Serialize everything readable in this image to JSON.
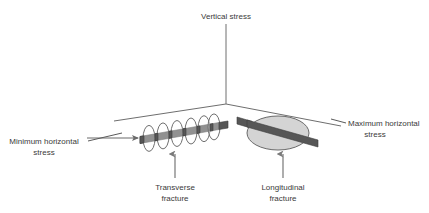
{
  "figure": {
    "title_present": false,
    "background_color": "#ffffff",
    "width": 429,
    "height": 213
  },
  "colors": {
    "axis": "#6e6e6e",
    "leader": "#5a5a5a",
    "wellbore_dark": "#565656",
    "wellbore_light": "#8e8e8e",
    "fracture_fill": "#d4d4d4",
    "disc_stroke": "#707070",
    "text": "#3a3a3a"
  },
  "labels": {
    "vertical_stress": "Vertical stress",
    "minimum_horizontal_stress_line1": "Minimum horizontal",
    "minimum_horizontal_stress_line2": "stress",
    "maximum_horizontal_stress_line1": "Maximum horizontal",
    "maximum_horizontal_stress_line2": "stress",
    "transverse_fracture_line1": "Transverse",
    "transverse_fracture_line2": "fracture",
    "longitudinal_fracture_line1": "Longitudinal",
    "longitudinal_fracture_line2": "fracture"
  },
  "axes": {
    "origin": {
      "x": 226,
      "y": 104
    },
    "vertical": {
      "x1": 226,
      "y1": 24,
      "x2": 226,
      "y2": 104
    },
    "left_horizontal": {
      "x1": 114,
      "y1": 121,
      "x2": 226,
      "y2": 104
    },
    "right_horizontal": {
      "x1": 226,
      "y1": 104,
      "x2": 341,
      "y2": 126
    }
  },
  "features": {
    "transverse": {
      "name": "transverse-fracture",
      "disc_count": 6,
      "wellbore": {
        "x1": 140,
        "y1": 140,
        "x2": 219,
        "y2": 126
      },
      "disc_rx": 6,
      "disc_ry": 13
    },
    "longitudinal": {
      "name": "longitudinal-fracture",
      "ellipse": {
        "cx": 278,
        "cy": 133,
        "rx": 31,
        "ry": 17
      },
      "wellbore": {
        "x1": 237,
        "y1": 120,
        "x2": 318,
        "y2": 143
      }
    }
  },
  "annotations": {
    "min_stress_arrow": {
      "x1": 87,
      "y1": 138,
      "x2": 140,
      "y2": 138
    },
    "transverse_arrow": {
      "x1": 175,
      "y1": 178,
      "x2": 175,
      "y2": 152
    },
    "longitudinal_arrow": {
      "x1": 283,
      "y1": 178,
      "x2": 283,
      "y2": 152
    },
    "min_stress_leader": {
      "x1": 90,
      "y1": 140,
      "x2": 120,
      "y2": 134
    },
    "max_stress_leader": {
      "x1": 330,
      "y1": 120,
      "x2": 345,
      "y2": 124
    }
  }
}
